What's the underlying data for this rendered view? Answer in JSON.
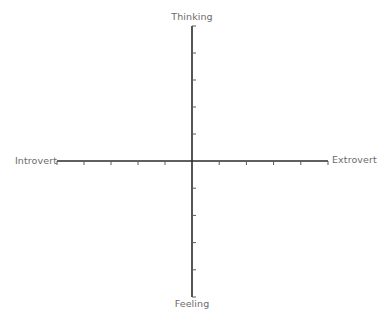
{
  "diagram": {
    "type": "quadrant-axes",
    "axes": {
      "vertical": {
        "top_label": "Thinking",
        "bottom_label": "Feeling",
        "ticks_per_side": 4
      },
      "horizontal": {
        "left_label": "Introvert",
        "right_label": "Extrovert",
        "ticks_per_side": 5
      }
    },
    "colors": {
      "axis": "#2b2b2b",
      "tick": "#5a5a5a",
      "label": "#6b6b6b"
    }
  }
}
